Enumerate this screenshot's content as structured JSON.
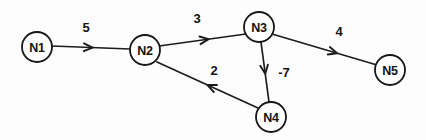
{
  "figure": {
    "type": "directed-weighted-graph",
    "background_color": "#fdfdfd",
    "stroke_color": "#1c1c1c",
    "text_color": "#121212",
    "width": 426,
    "height": 140
  },
  "graph": {
    "nodes": [
      {
        "id": "N1",
        "label": "N1",
        "cx": 37,
        "cy": 47,
        "r": 15
      },
      {
        "id": "N2",
        "label": "N2",
        "cx": 145,
        "cy": 50,
        "r": 15
      },
      {
        "id": "N3",
        "label": "N3",
        "cx": 259,
        "cy": 27,
        "r": 15
      },
      {
        "id": "N4",
        "label": "N4",
        "cx": 271,
        "cy": 117,
        "r": 15
      },
      {
        "id": "N5",
        "label": "N5",
        "cx": 390,
        "cy": 70,
        "r": 15
      }
    ],
    "edges": [
      {
        "id": "e-n1-n2",
        "from": "N1",
        "to": "N2",
        "weight": "5",
        "weight_x": 86,
        "weight_y": 27,
        "x1": 52,
        "y1": 46,
        "x2": 130,
        "y2": 49,
        "arrow_t": 0.52
      },
      {
        "id": "e-n2-n3",
        "from": "N2",
        "to": "N3",
        "weight": "3",
        "weight_x": 197,
        "weight_y": 18,
        "x1": 159,
        "y1": 46,
        "x2": 246,
        "y2": 34,
        "arrow_t": 0.57
      },
      {
        "id": "e-n3-n5",
        "from": "N3",
        "to": "N5",
        "weight": "4",
        "weight_x": 339,
        "weight_y": 31,
        "x1": 272,
        "y1": 34,
        "x2": 377,
        "y2": 65,
        "arrow_t": 0.62
      },
      {
        "id": "e-n3-n4",
        "from": "N3",
        "to": "N4",
        "weight": "-7",
        "weight_x": 284,
        "weight_y": 72,
        "x1": 261,
        "y1": 42,
        "x2": 269,
        "y2": 102,
        "arrow_t": 0.53
      },
      {
        "id": "e-n4-n2",
        "from": "N4",
        "to": "N2",
        "weight": "2",
        "weight_x": 214,
        "weight_y": 70,
        "x1": 258,
        "y1": 108,
        "x2": 157,
        "y2": 62,
        "arrow_t": 0.5
      }
    ]
  }
}
